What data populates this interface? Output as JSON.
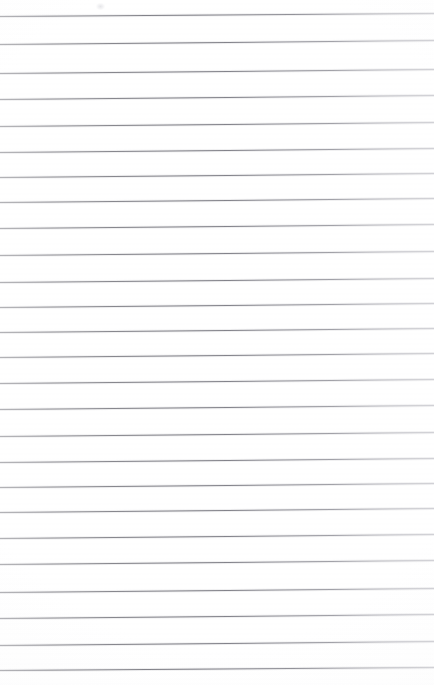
{
  "document": {
    "kind": "ruled-paper-scan",
    "description": "Blank scanned sheet of ruled notebook paper",
    "written_text": "",
    "page_width": 434,
    "page_height": 685,
    "paper_color": "#ffffff",
    "rule_color": "#76767e",
    "rule_count": 26,
    "rule_thickness_px": 1,
    "top_margin_px": 16,
    "bottom_margin_px": 14,
    "skew_note": "lines rise slightly toward the right edge",
    "rules": [
      {
        "index": 1,
        "y_left": 16,
        "y_right": 13,
        "tilt": -3.0
      },
      {
        "index": 2,
        "y_left": 44,
        "y_right": 40,
        "tilt": -4.0
      },
      {
        "index": 3,
        "y_left": 73,
        "y_right": 69,
        "tilt": -4.0
      },
      {
        "index": 4,
        "y_left": 99,
        "y_right": 95,
        "tilt": -4.0
      },
      {
        "index": 5,
        "y_left": 126,
        "y_right": 122,
        "tilt": -4.0
      },
      {
        "index": 6,
        "y_left": 152,
        "y_right": 148,
        "tilt": -4.0
      },
      {
        "index": 7,
        "y_left": 177,
        "y_right": 173,
        "tilt": -4.0
      },
      {
        "index": 8,
        "y_left": 202,
        "y_right": 198,
        "tilt": -4.0
      },
      {
        "index": 9,
        "y_left": 228,
        "y_right": 224,
        "tilt": -4.0
      },
      {
        "index": 10,
        "y_left": 255,
        "y_right": 251,
        "tilt": -4.0
      },
      {
        "index": 11,
        "y_left": 282,
        "y_right": 278,
        "tilt": -4.0
      },
      {
        "index": 12,
        "y_left": 307,
        "y_right": 303,
        "tilt": -4.0
      },
      {
        "index": 13,
        "y_left": 332,
        "y_right": 328,
        "tilt": -4.0
      },
      {
        "index": 14,
        "y_left": 357,
        "y_right": 353,
        "tilt": -4.0
      },
      {
        "index": 15,
        "y_left": 383,
        "y_right": 379,
        "tilt": -4.0
      },
      {
        "index": 16,
        "y_left": 409,
        "y_right": 405,
        "tilt": -4.0
      },
      {
        "index": 17,
        "y_left": 436,
        "y_right": 432,
        "tilt": -4.0
      },
      {
        "index": 18,
        "y_left": 462,
        "y_right": 458,
        "tilt": -4.0
      },
      {
        "index": 19,
        "y_left": 487,
        "y_right": 483,
        "tilt": -4.0
      },
      {
        "index": 20,
        "y_left": 512,
        "y_right": 508,
        "tilt": -4.0
      },
      {
        "index": 21,
        "y_left": 538,
        "y_right": 534,
        "tilt": -4.0
      },
      {
        "index": 22,
        "y_left": 564,
        "y_right": 560,
        "tilt": -4.0
      },
      {
        "index": 23,
        "y_left": 592,
        "y_right": 588,
        "tilt": -4.0
      },
      {
        "index": 24,
        "y_left": 618,
        "y_right": 614,
        "tilt": -4.0
      },
      {
        "index": 25,
        "y_left": 645,
        "y_right": 641,
        "tilt": -4.0
      },
      {
        "index": 26,
        "y_left": 670,
        "y_right": 667,
        "tilt": -3.0
      }
    ],
    "artifacts": [
      {
        "name": "faint-smudge",
        "x": 96,
        "y": 3,
        "width": 9,
        "height": 7
      }
    ]
  }
}
